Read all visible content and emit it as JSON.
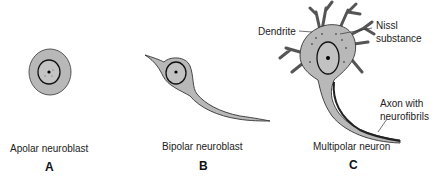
{
  "figure": {
    "panels": [
      {
        "letter": "A",
        "caption": "Apolar neuroblast"
      },
      {
        "letter": "B",
        "caption": "Bipolar neuroblast"
      },
      {
        "letter": "C",
        "caption": "Multipolar neuron"
      }
    ],
    "annotations": {
      "dendrite": "Dendrite",
      "nissl_1": "Nissl",
      "nissl_2": "substance",
      "axon_1": "Axon with",
      "axon_2": "neurofibrils"
    },
    "colors": {
      "cytoplasm": "#b8b8b8",
      "outline": "#1a1a1a",
      "text": "#222222"
    }
  }
}
